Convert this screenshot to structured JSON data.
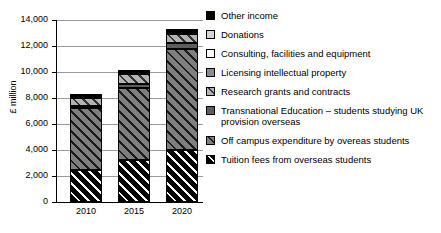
{
  "chart_data": {
    "type": "bar",
    "subtype": "stacked-vertical",
    "title": "",
    "xlabel": "",
    "ylabel": "£ million",
    "ylim": [
      0,
      14000
    ],
    "ytick_labels": [
      "0",
      "2,000",
      "4,000",
      "6,000",
      "8,000",
      "10,000",
      "12,000",
      "14,000"
    ],
    "ytick_values": [
      0,
      2000,
      4000,
      6000,
      8000,
      10000,
      12000,
      14000
    ],
    "grid": true,
    "legend_position": "right",
    "categories": [
      "2010",
      "2015",
      "2020"
    ],
    "series": [
      {
        "name": "Tuition fees from overseas students",
        "values": [
          2500,
          3200,
          4000
        ],
        "color": "#000000",
        "pattern": "diagonal-hatch-white"
      },
      {
        "name": "Off campus expenditure by overeas students",
        "values": [
          4700,
          5600,
          7800
        ],
        "color": "#7f7f7f",
        "pattern": "diagonal-hatch-dark"
      },
      {
        "name": "Transnational Education – students studying UK provision overseas",
        "values": [
          200,
          250,
          400
        ],
        "color": "#5d5d5d",
        "pattern": "solid"
      },
      {
        "name": "Research grants and contracts",
        "values": [
          600,
          800,
          750
        ],
        "color": "#b3b3b3",
        "pattern": "diagonal-hatch-dark"
      },
      {
        "name": "Licensing intellectual property",
        "values": [
          50,
          60,
          70
        ],
        "color": "#8a8a8a",
        "pattern": "solid"
      },
      {
        "name": "Consulting, facilities and equipment",
        "values": [
          50,
          60,
          70
        ],
        "color": "#ffffff",
        "pattern": "solid"
      },
      {
        "name": "Donations",
        "values": [
          50,
          60,
          70
        ],
        "color": "#d4d4d4",
        "pattern": "solid"
      },
      {
        "name": "Other income",
        "values": [
          100,
          150,
          150
        ],
        "color": "#000000",
        "pattern": "solid"
      }
    ],
    "totals": [
      8250,
      10180,
      13110
    ]
  },
  "axis": {
    "y_title": "£ million",
    "y_labels": [
      "14,000",
      "12,000",
      "10,000",
      "8,000",
      "6,000",
      "4,000",
      "2,000",
      "0"
    ],
    "x_labels": [
      "2010",
      "2015",
      "2020"
    ]
  },
  "legend": {
    "items": [
      {
        "label": "Other income",
        "swatch": "swatch-other-income"
      },
      {
        "label": "Donations",
        "swatch": "swatch-donations"
      },
      {
        "label": "Consulting, facilities and equipment",
        "swatch": "swatch-consulting"
      },
      {
        "label": "Licensing intellectual property",
        "swatch": "swatch-licensing"
      },
      {
        "label": "Research grants and contracts",
        "swatch": "swatch-research"
      },
      {
        "label": "Transnational Education – students studying UK provision overseas",
        "swatch": "swatch-transnational"
      },
      {
        "label": "Off campus expenditure by overeas students",
        "swatch": "swatch-offcampus"
      },
      {
        "label": "Tuition fees from overseas students",
        "swatch": "swatch-tuition"
      }
    ]
  }
}
